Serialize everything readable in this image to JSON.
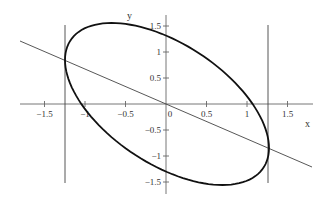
{
  "chart_data": {
    "type": "line",
    "title": "",
    "xlabel": "x",
    "ylabel": "y",
    "xlim": [
      -1.8,
      1.8
    ],
    "ylim": [
      -1.75,
      1.7
    ],
    "grid": false,
    "legend": null,
    "x_ticks": [
      -1.5,
      -1,
      -0.5,
      0,
      0.5,
      1,
      1.5
    ],
    "x_tick_labels": [
      "−1.5",
      "−1",
      "−0.5",
      "0",
      "0.5",
      "1",
      "1.5"
    ],
    "y_ticks": [
      -1.5,
      -1,
      -0.5,
      0.5,
      1,
      1.5
    ],
    "y_tick_labels": [
      "−1.5",
      "−1",
      "−0.5",
      "0.5",
      "1",
      "1.5"
    ],
    "series": [
      {
        "name": "ellipse",
        "kind": "closed-curve",
        "description": "tilted ellipse centered at origin, extending from upper-left to lower-right",
        "extremes": {
          "leftmost": [
            -1.26,
            0.83
          ],
          "rightmost": [
            1.26,
            -0.83
          ],
          "top": [
            -0.7,
            1.55
          ],
          "bottom": [
            0.7,
            -1.55
          ]
        },
        "color": "#111111",
        "stroke_width": 1.8
      },
      {
        "name": "line",
        "kind": "line",
        "description": "straight line through origin and the leftmost/rightmost points of the ellipse",
        "points": [
          [
            -1.8,
            1.2
          ],
          [
            1.8,
            -1.2
          ]
        ],
        "slope": -0.66,
        "color": "#444444",
        "stroke_width": 0.9
      },
      {
        "name": "left-vertical",
        "kind": "vline",
        "x": -1.26,
        "y_range": [
          -1.5,
          1.5
        ],
        "color": "#444444",
        "stroke_width": 0.9
      },
      {
        "name": "right-vertical",
        "kind": "vline",
        "x": 1.26,
        "y_range": [
          -1.5,
          1.5
        ],
        "color": "#444444",
        "stroke_width": 0.9
      }
    ]
  },
  "render": {
    "origin_px": [
      166,
      104
    ],
    "x_scale_px": 81,
    "y_scale_px": 52,
    "ellipse_px": {
      "cx": 167,
      "cy": 104,
      "ux": 102,
      "uy": 44,
      "vx": 0,
      "vy": 68
    },
    "x_axis_px": [
      20,
      313
    ],
    "y_axis_px": [
      15,
      194
    ],
    "line_px": [
      [
        20,
        41
      ],
      [
        312,
        167
      ]
    ],
    "vlines_px": [
      {
        "x": 65,
        "y1": 25,
        "y2": 183
      },
      {
        "x": 268,
        "y1": 25,
        "y2": 183
      }
    ],
    "xlabel_px": [
      305,
      127
    ],
    "ylabel_px": [
      127,
      19
    ],
    "axis_color": "#666666",
    "text_color": "#333333"
  }
}
